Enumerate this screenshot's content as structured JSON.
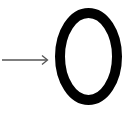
{
  "figure": {
    "arrow": {
      "direction": "right",
      "color": "#555555"
    },
    "symbol": {
      "text": "0",
      "color": "#000000"
    }
  }
}
